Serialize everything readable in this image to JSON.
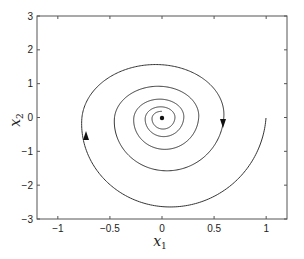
{
  "chart_data": {
    "type": "line",
    "title": "",
    "xlabel": "x1",
    "ylabel": "x2",
    "xlabel_main": "x",
    "xlabel_sub": "1",
    "ylabel_main": "x",
    "ylabel_sub": "2",
    "xlim": [
      -1.2,
      1.2
    ],
    "ylim": [
      -3,
      3
    ],
    "xticks": [
      -1,
      -0.5,
      0,
      0.5,
      1
    ],
    "xtick_labels": [
      "−1",
      "−0.5",
      "0",
      "0.5",
      "1"
    ],
    "yticks": [
      -3,
      -2,
      -1,
      0,
      1,
      2,
      3
    ],
    "ytick_labels": [
      "−3",
      "−2",
      "−1",
      "0",
      "1",
      "2",
      "3"
    ],
    "grid": false,
    "legend": null,
    "series": [
      {
        "name": "phase trajectory (stable spiral / focus)",
        "start_point": [
          1.0,
          0.0
        ],
        "equilibrium": [
          0.0,
          0.0
        ],
        "direction": "clockwise",
        "approx_points": [
          [
            1.0,
            0.0
          ],
          [
            0.08,
            -2.6
          ],
          [
            -0.75,
            0.0
          ],
          [
            -0.1,
            2.05
          ],
          [
            0.59,
            0.0
          ],
          [
            -0.45,
            0.0
          ],
          [
            0.35,
            0.0
          ],
          [
            -0.27,
            0.0
          ],
          [
            0.2,
            0.0
          ],
          [
            0.0,
            0.0
          ]
        ]
      }
    ],
    "annotations": [
      {
        "type": "arrow",
        "at": [
          -0.75,
          -0.55
        ],
        "direction": "up"
      },
      {
        "type": "arrow",
        "at": [
          0.59,
          -0.05
        ],
        "direction": "down"
      },
      {
        "type": "marker",
        "at": [
          0.0,
          0.0
        ],
        "shape": "filled-dot"
      }
    ]
  },
  "render": {
    "frame": {
      "left": 37,
      "top": 16,
      "right": 287,
      "bottom": 219
    },
    "spiral": {
      "cx": 162,
      "cy": 118,
      "rx0": 104,
      "ry0": 101,
      "decay_per_rad": 0.083,
      "turns": 9.5
    },
    "line_color": "#333333",
    "axis_color": "#555555"
  }
}
